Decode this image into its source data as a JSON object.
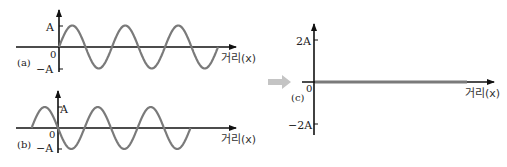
{
  "panels": {
    "a": {
      "tag": "(a)",
      "y_max_label": "A",
      "y_min_label": "−A",
      "origin_label": "0",
      "x_axis_label": "거리(x)",
      "wave": "sin",
      "phase_start": 0,
      "periods": 3
    },
    "b": {
      "tag": "(b)",
      "y_max_label": "A",
      "y_min_label": "−A",
      "origin_label": "0",
      "x_axis_label": "거리(x)",
      "wave": "-sin",
      "start_offset_periods": -0.5,
      "periods": 3
    },
    "c": {
      "tag": "(c)",
      "y_max_label": "2A",
      "y_min_label": "−2A",
      "origin_label": "0",
      "x_axis_label": "거리(x)",
      "wave": "flat (superposition = 0)"
    }
  },
  "arrow": "right-arrow",
  "colors": {
    "wave": "#7a7a7a",
    "axis": "#111111",
    "arrow": "#c4c4c4"
  }
}
